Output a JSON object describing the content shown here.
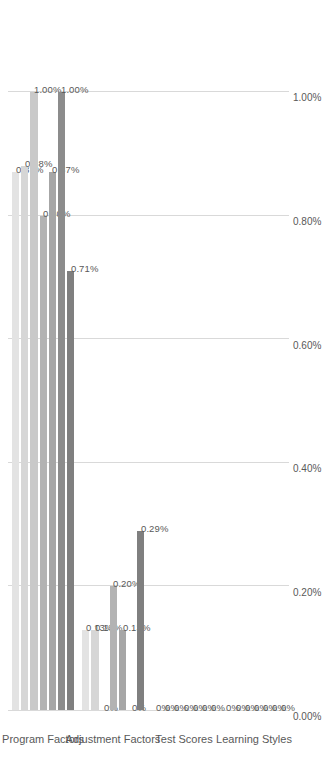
{
  "chart_data": {
    "type": "bar",
    "orientation": "horizontal",
    "title": "",
    "xlabel": "",
    "ylabel": "",
    "xlim": [
      0,
      1.0
    ],
    "grid": true,
    "legend_position": "bottom",
    "tick_labels": [
      "0.00%",
      "0.20%",
      "0.40%",
      "0.60%",
      "0.80%",
      "1.00%"
    ],
    "tick_values": [
      0,
      0.2,
      0.4,
      0.6,
      0.8,
      1.0
    ],
    "categories": [
      "Program Factors",
      "Adjustment Factors",
      "Test Scores",
      "Learning Styles"
    ],
    "series": [
      {
        "name": "All Students",
        "color": "#e3e3e3",
        "values": [
          0.87,
          0.13,
          0,
          0
        ],
        "labels": [
          "0.87%",
          "0.13%",
          "0%",
          "0%"
        ]
      },
      {
        "name": "All Males",
        "color": "#d6d6d6",
        "values": [
          0.88,
          0.13,
          0,
          0
        ],
        "labels": [
          "0.88%",
          "0.13%",
          "0%",
          "0%"
        ]
      },
      {
        "name": "Non-Minority Males",
        "color": "#c9c9c9",
        "values": [
          1.0,
          0,
          0,
          0
        ],
        "labels": [
          "1.00%",
          "0%",
          "0%",
          "0%"
        ]
      },
      {
        "name": "Minority Males",
        "color": "#b3b3b3",
        "values": [
          0.8,
          0.2,
          0,
          0
        ],
        "labels": [
          "0.80%",
          "0.20%",
          "0%",
          "0%"
        ]
      },
      {
        "name": "All Females",
        "color": "#a6a6a6",
        "values": [
          0.87,
          0.13,
          0,
          0
        ],
        "labels": [
          "0.87%",
          "0.13%",
          "0%",
          "0%"
        ]
      },
      {
        "name": "Non-Minority Females",
        "color": "#8c8c8c",
        "values": [
          1.0,
          0,
          0,
          0
        ],
        "labels": [
          "1.00%",
          "0%",
          "0%",
          "0%"
        ]
      },
      {
        "name": "Minority Females",
        "color": "#7f7f7f",
        "values": [
          0.71,
          0.29,
          0,
          0
        ],
        "labels": [
          "0.71%",
          "0.29%",
          "0%",
          "0%"
        ]
      }
    ]
  }
}
